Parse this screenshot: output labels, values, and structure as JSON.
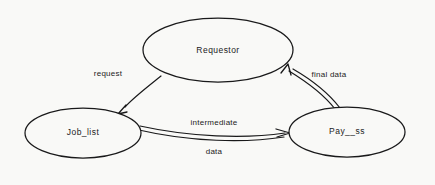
{
  "diagram": {
    "background_color": "#f9f9f7",
    "stroke_color": "#19191a",
    "nodes": [
      {
        "id": "requestor",
        "label": "Requestor",
        "shape": "ellipse",
        "cx": 218,
        "cy": 50,
        "rx": 75,
        "ry": 32
      },
      {
        "id": "job_list",
        "label": "Job_list",
        "shape": "ellipse",
        "cx": 83,
        "cy": 133,
        "rx": 58,
        "ry": 25
      },
      {
        "id": "payss",
        "label": "Pay__ss",
        "shape": "ellipse",
        "cx": 347,
        "cy": 132,
        "rx": 58,
        "ry": 25
      }
    ],
    "edges": [
      {
        "id": "request",
        "label": "request",
        "from": "requestor",
        "to": "job_list",
        "style": "single-line",
        "arrowhead": "to"
      },
      {
        "id": "intermediate-data",
        "label_top": "intermediate",
        "label_bottom": "data",
        "from": "job_list",
        "to": "payss",
        "style": "double-line",
        "arrowhead": "to"
      },
      {
        "id": "final-data",
        "label": "final data",
        "from": "payss",
        "to": "requestor",
        "style": "double-line",
        "arrowhead": "to"
      }
    ]
  }
}
